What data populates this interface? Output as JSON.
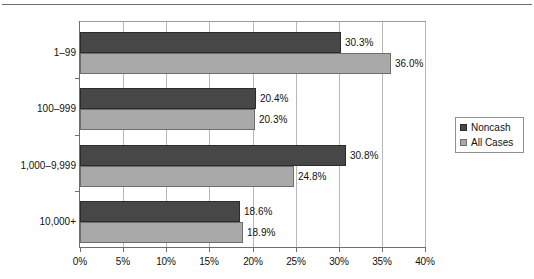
{
  "chart_data": {
    "type": "bar",
    "orientation": "horizontal",
    "title": "",
    "xlabel": "",
    "ylabel": "",
    "categories": [
      "1–99",
      "100–999",
      "1,000–9,999",
      "10,000+"
    ],
    "series": [
      {
        "name": "Noncash",
        "color": "#474747",
        "values": [
          30.3,
          20.4,
          30.8,
          18.6
        ],
        "labels": [
          "30.3%",
          "20.4%",
          "30.8%",
          "18.6%"
        ]
      },
      {
        "name": "All Cases",
        "color": "#a9a9a9",
        "values": [
          36.0,
          20.3,
          24.8,
          18.9
        ],
        "labels": [
          "36.0%",
          "20.3%",
          "24.8%",
          "18.9%"
        ]
      }
    ],
    "xlim": [
      0,
      40
    ],
    "xticks": [
      0,
      5,
      10,
      15,
      20,
      25,
      30,
      35,
      40
    ],
    "xticklabels": [
      "0%",
      "5%",
      "10%",
      "15%",
      "20%",
      "25%",
      "30%",
      "35%",
      "40%"
    ],
    "grid": true,
    "legend_position": "right"
  },
  "legend": {
    "entries": [
      {
        "label": "Noncash",
        "swatch": "noncash-swatch"
      },
      {
        "label": "All Cases",
        "swatch": "all-cases-swatch"
      }
    ]
  }
}
